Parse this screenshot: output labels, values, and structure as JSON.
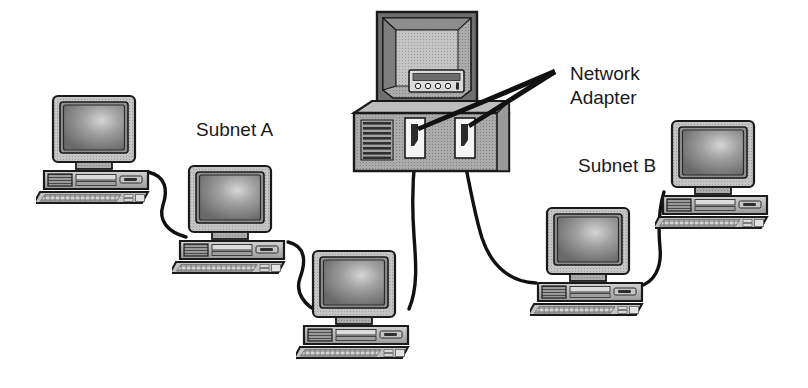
{
  "diagram": {
    "type": "network-topology",
    "background_color": "#ffffff",
    "labels": [
      {
        "id": "subnet-a",
        "text": "Subnet A",
        "x": 196,
        "y": 136
      },
      {
        "id": "network-adapter-line1",
        "text": "Network",
        "x": 570,
        "y": 80
      },
      {
        "id": "network-adapter-line2",
        "text": "Adapter",
        "x": 570,
        "y": 104
      },
      {
        "id": "subnet-b",
        "text": "Subnet B",
        "x": 578,
        "y": 172
      }
    ],
    "palette": {
      "outline": "#1a1a1a",
      "cable": "#111111",
      "case_light": "#c9c9c9",
      "case_mid": "#a8a8a8",
      "case_dark": "#8a8a8a",
      "case_darker": "#6e6e6e",
      "screen_dark": "#6b6b6b",
      "screen_light": "#d8d8d8",
      "vent_dark": "#3a3a3a",
      "port_white": "#f2f2f2",
      "port_slot": "#2b2b2b",
      "server_top": "#b5b5b5",
      "server_front": "#9c9c9c",
      "server_side": "#bdbdbd"
    },
    "server": {
      "id": "network-server",
      "name": "central-server",
      "has_monitor": true,
      "control_panel": {
        "buttons": 4,
        "has_display_strip": true
      },
      "vent_slats": 8,
      "adapters": [
        {
          "id": "network-adapter-port-1",
          "label": "Network Adapter",
          "side": "left"
        },
        {
          "id": "network-adapter-port-2",
          "label": "Network Adapter",
          "side": "right"
        }
      ]
    },
    "workstations": [
      {
        "id": "workstation-a1",
        "subnet": "Subnet A",
        "x": 36,
        "y": 93,
        "scale": 1.0
      },
      {
        "id": "workstation-a2",
        "subnet": "Subnet A",
        "x": 172,
        "y": 163,
        "scale": 1.0
      },
      {
        "id": "workstation-a3",
        "subnet": "Subnet A",
        "x": 296,
        "y": 248,
        "scale": 1.0
      },
      {
        "id": "workstation-b1",
        "subnet": "Subnet B",
        "x": 530,
        "y": 205,
        "scale": 1.0
      },
      {
        "id": "workstation-b2",
        "subnet": "Subnet B",
        "x": 655,
        "y": 118,
        "scale": 1.0
      }
    ],
    "cables": [
      {
        "id": "cable-a1-a2",
        "from": "workstation-a1",
        "to": "workstation-a2"
      },
      {
        "id": "cable-a2-a3",
        "from": "workstation-a2",
        "to": "workstation-a3"
      },
      {
        "id": "cable-a3-server",
        "from": "workstation-a3",
        "to": "network-adapter-port-1"
      },
      {
        "id": "cable-server-b1",
        "from": "network-adapter-port-2",
        "to": "workstation-b1"
      },
      {
        "id": "cable-b1-b2",
        "from": "workstation-b1",
        "to": "workstation-b2"
      }
    ],
    "leader_lines": [
      {
        "id": "leader-to-adapter-1",
        "target": "network-adapter-port-1"
      },
      {
        "id": "leader-to-adapter-2",
        "target": "network-adapter-port-2"
      }
    ]
  }
}
